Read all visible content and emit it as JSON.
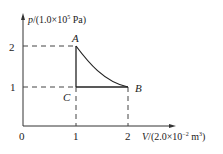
{
  "diagram": {
    "type": "p-V diagram",
    "y_axis": {
      "symbol": "p",
      "unit_prefix": "/(1.0×10",
      "exp": "5",
      "unit_suffix": " Pa)",
      "ticks": [
        "2",
        "1"
      ]
    },
    "x_axis": {
      "symbol": "V",
      "unit_prefix": "/(2.0×10",
      "exp": "−2",
      "unit_mid": " m",
      "unit_exp": "3",
      "unit_suffix": ")",
      "ticks": [
        "0",
        "1",
        "2"
      ]
    },
    "points": {
      "A": {
        "label": "A",
        "V": 1,
        "p": 2
      },
      "B": {
        "label": "B",
        "V": 2,
        "p": 1
      },
      "C": {
        "label": "C",
        "V": 1,
        "p": 1
      }
    },
    "paths": [
      "A→B curve (isotherm)",
      "B→C horizontal",
      "C→A vertical"
    ]
  },
  "colors": {
    "line": "#222222",
    "background": "#ffffff"
  }
}
